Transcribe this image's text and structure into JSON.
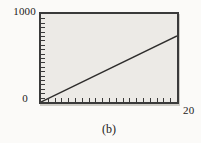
{
  "figure": {
    "caption": "(b)"
  },
  "chart_data": {
    "type": "line",
    "title": "",
    "xlabel": "",
    "ylabel": "",
    "xlim": [
      0,
      20
    ],
    "ylim": [
      0,
      1000
    ],
    "x_tick_count": 20,
    "y_tick_count": 20,
    "x_tick_interval": 1,
    "y_tick_interval": 50,
    "grid": false,
    "legend_position": "none",
    "axis_tick_labels": {
      "y_max": "1000",
      "origin": "0",
      "x_max": "20"
    },
    "plot_bg": "#eceae6",
    "border_color": "#3a3a3a",
    "line_color": "#2e2d2c",
    "series": [
      {
        "name": "line",
        "points": [
          [
            0,
            0
          ],
          [
            20,
            750
          ]
        ]
      }
    ],
    "caption": "(b)"
  }
}
